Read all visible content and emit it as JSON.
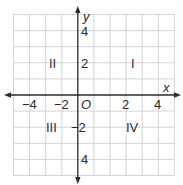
{
  "diagram": {
    "type": "coordinate-plane",
    "grid": {
      "color": "#d4d4d4",
      "cell_px": 16.1
    },
    "axes": {
      "color": "#2a2a2a",
      "x_label": "x",
      "y_label": "y",
      "origin_label": "O",
      "x_ticks": [
        {
          "value": -4,
          "label": "−4"
        },
        {
          "value": -2,
          "label": "−2"
        },
        {
          "value": 2,
          "label": "2"
        },
        {
          "value": 4,
          "label": "4"
        }
      ],
      "y_ticks": [
        {
          "value": 4,
          "label": "4"
        },
        {
          "value": 2,
          "label": "2"
        },
        {
          "value": -2,
          "label": "−2"
        },
        {
          "value": -4,
          "label": "4"
        }
      ],
      "x_range": [
        -4,
        6
      ],
      "y_range": [
        -5,
        5
      ]
    },
    "quadrants": [
      {
        "id": "I",
        "label": "I"
      },
      {
        "id": "II",
        "label": "II"
      },
      {
        "id": "III",
        "label": "III"
      },
      {
        "id": "IV",
        "label": "IV"
      }
    ]
  }
}
